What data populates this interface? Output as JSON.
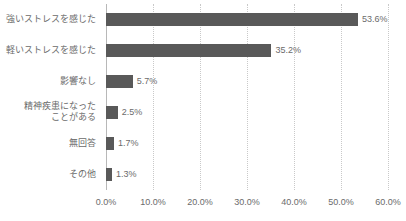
{
  "chart_data": {
    "type": "bar",
    "orientation": "horizontal",
    "title": "",
    "subtitle": "",
    "xlabel": "",
    "ylabel": "",
    "xlim": [
      0,
      60
    ],
    "grid": true,
    "legend": false,
    "units": "percent",
    "bar_color": "#595959",
    "gridline_color": "#c9c9c9",
    "text_color": "#6b6b6b",
    "categories": [
      "強いストレスを感じた",
      "軽いストレスを感じた",
      "影響なし",
      "精神疾患になったことがある",
      "無回答",
      "その他"
    ],
    "category_lines": [
      [
        "強いストレスを感じた"
      ],
      [
        "軽いストレスを感じた"
      ],
      [
        "影響なし"
      ],
      [
        "精神疾患になった",
        "ことがある"
      ],
      [
        "無回答"
      ],
      [
        "その他"
      ]
    ],
    "values": [
      53.6,
      35.2,
      5.7,
      2.5,
      1.7,
      1.3
    ],
    "value_labels": [
      "53.6%",
      "35.2%",
      "5.7%",
      "2.5%",
      "1.7%",
      "1.3%"
    ],
    "xticks": [
      0,
      10,
      20,
      30,
      40,
      50,
      60
    ],
    "xtick_labels": [
      "0.0%",
      "10.0%",
      "20.0%",
      "30.0%",
      "40.0%",
      "50.0%",
      "60.0%"
    ]
  }
}
